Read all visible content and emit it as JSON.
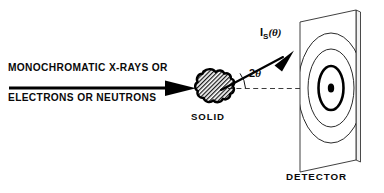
{
  "figure": {
    "background_color": "#ffffff",
    "ink_color": "#000000",
    "width": 384,
    "height": 193
  },
  "labels": {
    "incident_line1": "MONOCHROMATIC  X-RAYS OR",
    "incident_line2": "ELECTRONS OR NEUTRONS",
    "sample": "SOLID",
    "detector": "DETECTOR",
    "scattered_intensity": {
      "symbol": "I",
      "subscript": "S",
      "argument": "(θ)",
      "full": "I_S(θ)"
    },
    "scattering_angle": {
      "coefficient": "2",
      "symbol": "θ",
      "full": "2θ"
    }
  },
  "elements": {
    "incident_beam": {
      "name": "incident-beam-arrow",
      "style": "solid-thick-arrow",
      "direction": "left-to-right"
    },
    "sample": {
      "name": "solid-sample",
      "style": "irregular-blob-hatched",
      "hatch": "diagonal-crosshatch"
    },
    "transmitted_axis": {
      "name": "transmitted-beam-axis",
      "style": "dashed-thin-line"
    },
    "scattered_beam": {
      "name": "scattered-beam-arrow",
      "style": "solid-arrow",
      "direction": "up-right"
    },
    "angle_arc": {
      "name": "scattering-angle-arc",
      "style": "thin-arc"
    },
    "detector": {
      "name": "detector-panel",
      "style": "3d-parallelogram-plate",
      "rings": [
        "center-dot",
        "inner-thick-ring",
        "middle-ring",
        "outer-ring"
      ],
      "ring_count": 3
    }
  }
}
